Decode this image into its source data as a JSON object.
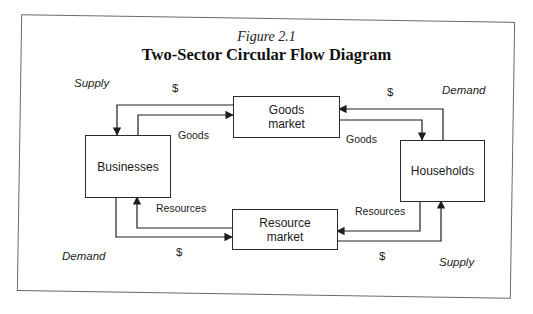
{
  "figure": {
    "number": "Figure 2.1",
    "title": "Two-Sector Circular Flow Diagram"
  },
  "nodes": {
    "businesses": "Businesses",
    "households": "Households",
    "goods_market_line1": "Goods",
    "goods_market_line2": "market",
    "resource_market_line1": "Resource",
    "resource_market_line2": "market"
  },
  "flow_labels": {
    "top_left_dollar": "$",
    "top_left_goods": "Goods",
    "top_right_dollar": "$",
    "top_right_goods": "Goods",
    "bottom_left_resources": "Resources",
    "bottom_left_dollar": "$",
    "bottom_right_resources": "Resources",
    "bottom_right_dollar": "$"
  },
  "corner_labels": {
    "top_left": "Supply",
    "top_right": "Demand",
    "bottom_left": "Demand",
    "bottom_right": "Supply"
  },
  "colors": {
    "line": "#1e1e1e",
    "frame": "#6a6a6a"
  }
}
